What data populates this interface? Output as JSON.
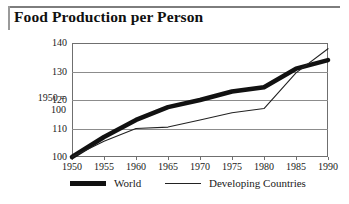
{
  "figure": {
    "title": "Food Production per Person",
    "axis_caption_line1": "1950 =",
    "axis_caption_line2": "100"
  },
  "chart_data": {
    "type": "line",
    "title": "Food Production per Person",
    "xlabel": "",
    "ylabel": "1950 = 100",
    "x": [
      1950,
      1955,
      1960,
      1965,
      1970,
      1975,
      1980,
      1985,
      1990
    ],
    "categories": [
      "1950",
      "1955",
      "1960",
      "1965",
      "1970",
      "1975",
      "1980",
      "1985",
      "1990"
    ],
    "xlim": [
      1950,
      1990
    ],
    "ylim": [
      100,
      140
    ],
    "yticks": [
      100,
      110,
      120,
      130,
      140
    ],
    "ytick_labels": [
      "100",
      "110",
      "120",
      "130",
      "140"
    ],
    "grid": true,
    "legend_position": "bottom",
    "series": [
      {
        "name": "World",
        "style": "thick",
        "color": "#111111",
        "values": [
          100,
          107,
          113,
          117.5,
          120,
          123,
          124.5,
          131,
          134
        ]
      },
      {
        "name": "Developing Countries",
        "style": "thin",
        "color": "#222222",
        "values": [
          100,
          105.5,
          110,
          110.5,
          113,
          115.5,
          117,
          129.5,
          138
        ]
      }
    ]
  },
  "legend": {
    "items": [
      {
        "label": "World",
        "swatch": "thick-line-swatch"
      },
      {
        "label": "Developing Countries",
        "swatch": "thin-line-swatch"
      }
    ]
  }
}
